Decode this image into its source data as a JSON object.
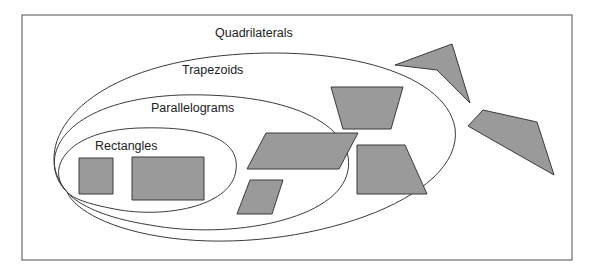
{
  "diagram": {
    "title": "",
    "sets": [
      {
        "id": "quadrilaterals",
        "label": "Quadrilaterals"
      },
      {
        "id": "trapezoids",
        "label": "Trapezoids"
      },
      {
        "id": "parallelograms",
        "label": "Parallelograms"
      },
      {
        "id": "rectangles",
        "label": "Rectangles"
      }
    ],
    "shapes": [
      {
        "set": "rectangles",
        "kind": "square"
      },
      {
        "set": "rectangles",
        "kind": "rectangle"
      },
      {
        "set": "parallelograms",
        "kind": "parallelogram-large"
      },
      {
        "set": "parallelograms",
        "kind": "parallelogram-small"
      },
      {
        "set": "trapezoids",
        "kind": "trapezoid-inverted"
      },
      {
        "set": "trapezoids",
        "kind": "trapezoid-right"
      },
      {
        "set": "quadrilaterals",
        "kind": "concave-kite"
      },
      {
        "set": "quadrilaterals",
        "kind": "irregular-quadrilateral"
      }
    ],
    "colors": {
      "shape_fill": "#9a9a9a",
      "outline": "#3a3a3a",
      "frame": "#6a6a6a",
      "background": "#ffffff"
    }
  }
}
